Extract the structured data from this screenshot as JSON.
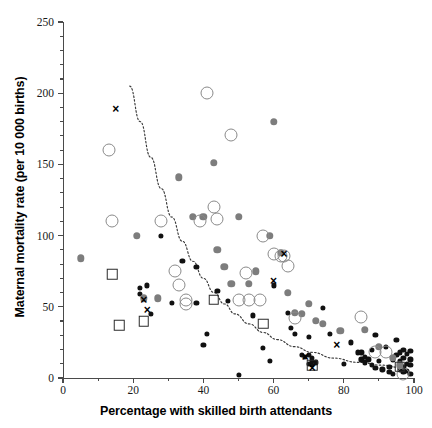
{
  "chart_data": {
    "type": "scatter",
    "title": "",
    "xlabel": "Percentage with skilled birth attendants",
    "ylabel": "Maternal mortality rate (per 10 000 births)",
    "xlim": [
      0,
      100
    ],
    "ylim": [
      0,
      250
    ],
    "x_ticks": [
      0,
      20,
      40,
      60,
      80,
      100
    ],
    "y_ticks": [
      0,
      50,
      100,
      150,
      200,
      250
    ],
    "x_minor_step": 10,
    "y_minor_step": 10,
    "grid": false,
    "legend": null,
    "trend_line": {
      "style": "dotted",
      "description": "decreasing curve fitted through the data",
      "points": [
        [
          19,
          205
        ],
        [
          22,
          180
        ],
        [
          25,
          155
        ],
        [
          28,
          133
        ],
        [
          31,
          113
        ],
        [
          34,
          96
        ],
        [
          37,
          82
        ],
        [
          40,
          70
        ],
        [
          43,
          60
        ],
        [
          46,
          52
        ],
        [
          49,
          45
        ],
        [
          53,
          38
        ],
        [
          57,
          32
        ],
        [
          61,
          27
        ],
        [
          66,
          22
        ],
        [
          71,
          18
        ],
        [
          77,
          14
        ],
        [
          84,
          11
        ],
        [
          91,
          9
        ],
        [
          97,
          7
        ]
      ]
    },
    "series": [
      {
        "name": "black-filled-circles",
        "marker": "m-blackdot",
        "color": "#111111",
        "points": [
          [
            22,
            63
          ],
          [
            22,
            59
          ],
          [
            24,
            65
          ],
          [
            25,
            45
          ],
          [
            28,
            100
          ],
          [
            31,
            53
          ],
          [
            34,
            82
          ],
          [
            38,
            78
          ],
          [
            38,
            53
          ],
          [
            40,
            23
          ],
          [
            41,
            31
          ],
          [
            44,
            61
          ],
          [
            47,
            54
          ],
          [
            50,
            2
          ],
          [
            54,
            44
          ],
          [
            57,
            21
          ],
          [
            59,
            12
          ],
          [
            60,
            65
          ],
          [
            64,
            46
          ],
          [
            65,
            35
          ],
          [
            66,
            31
          ],
          [
            68,
            16
          ],
          [
            69,
            15
          ],
          [
            70,
            16
          ],
          [
            70,
            29
          ],
          [
            70,
            10
          ],
          [
            71,
            9
          ],
          [
            71,
            12
          ],
          [
            71,
            14
          ],
          [
            72,
            11
          ],
          [
            74,
            49
          ],
          [
            76,
            31
          ],
          [
            80,
            10
          ],
          [
            82,
            25
          ],
          [
            84,
            18
          ],
          [
            85,
            18
          ],
          [
            85,
            13
          ],
          [
            86,
            15
          ],
          [
            86,
            11
          ],
          [
            87,
            13
          ],
          [
            88,
            9
          ],
          [
            88,
            20
          ],
          [
            89,
            30
          ],
          [
            89,
            7
          ],
          [
            90,
            12
          ],
          [
            91,
            6
          ],
          [
            92,
            22
          ],
          [
            93,
            8
          ],
          [
            93,
            4
          ],
          [
            94,
            13
          ],
          [
            94,
            3
          ],
          [
            95,
            16
          ],
          [
            95,
            27
          ],
          [
            96,
            18
          ],
          [
            96,
            12
          ],
          [
            96,
            6
          ],
          [
            97,
            8
          ],
          [
            97,
            20
          ],
          [
            97,
            14
          ],
          [
            97,
            4
          ],
          [
            98,
            10
          ],
          [
            98,
            17
          ],
          [
            98,
            5
          ],
          [
            99,
            9
          ],
          [
            99,
            13
          ],
          [
            99,
            3
          ],
          [
            99,
            19
          ]
        ]
      },
      {
        "name": "gray-filled-circles",
        "marker": "m-graydot",
        "color": "#7d7d7d",
        "points": [
          [
            5,
            84
          ],
          [
            21,
            100
          ],
          [
            23,
            56
          ],
          [
            27,
            56
          ],
          [
            33,
            141
          ],
          [
            37,
            113
          ],
          [
            40,
            113
          ],
          [
            43,
            151
          ],
          [
            44,
            90
          ],
          [
            46,
            78
          ],
          [
            48,
            66
          ],
          [
            50,
            113
          ],
          [
            53,
            66
          ],
          [
            55,
            75
          ],
          [
            59,
            100
          ],
          [
            60,
            180
          ],
          [
            62,
            88
          ],
          [
            64,
            60
          ],
          [
            66,
            46
          ],
          [
            68,
            45
          ],
          [
            70,
            52
          ],
          [
            72,
            40
          ],
          [
            74,
            38
          ],
          [
            79,
            33
          ],
          [
            86,
            34
          ],
          [
            90,
            22
          ],
          [
            94,
            14
          ],
          [
            96,
            9
          ]
        ]
      },
      {
        "name": "open-circles",
        "marker": "m-opencircle",
        "color": "#8a8a8a",
        "points": [
          [
            13,
            160
          ],
          [
            14,
            110
          ],
          [
            28,
            110
          ],
          [
            32,
            75
          ],
          [
            33,
            65
          ],
          [
            35,
            55
          ],
          [
            35,
            52
          ],
          [
            39,
            110
          ],
          [
            41,
            200
          ],
          [
            43,
            120
          ],
          [
            44,
            112
          ],
          [
            48,
            171
          ],
          [
            50,
            55
          ],
          [
            52,
            74
          ],
          [
            53,
            55
          ],
          [
            56,
            55
          ],
          [
            57,
            100
          ],
          [
            60,
            87
          ],
          [
            62,
            86
          ],
          [
            63,
            86
          ],
          [
            64,
            79
          ],
          [
            66,
            42
          ],
          [
            85,
            43
          ],
          [
            89,
            18
          ],
          [
            92,
            18
          ],
          [
            97,
            3
          ]
        ]
      },
      {
        "name": "open-squares",
        "marker": "m-square",
        "color": "#2b2b2b",
        "points": [
          [
            14,
            73
          ],
          [
            16,
            37
          ],
          [
            23,
            40
          ],
          [
            43,
            55
          ],
          [
            57,
            38
          ],
          [
            71,
            9
          ],
          [
            96,
            8
          ]
        ]
      },
      {
        "name": "x-markers",
        "marker": "m-ex",
        "color": "#000000",
        "points": [
          [
            15,
            189
          ],
          [
            23,
            55
          ],
          [
            24,
            48
          ],
          [
            60,
            68
          ],
          [
            63,
            87
          ],
          [
            69,
            15
          ],
          [
            71,
            7
          ],
          [
            78,
            23
          ]
        ]
      }
    ]
  },
  "axis": {
    "x_labels": [
      "0",
      "20",
      "40",
      "60",
      "80",
      "100"
    ],
    "y_labels": [
      "0",
      "50",
      "100",
      "150",
      "200",
      "250"
    ]
  }
}
